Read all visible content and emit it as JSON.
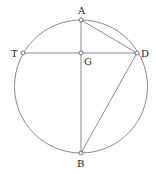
{
  "diagram": {
    "type": "geometry",
    "circle": {
      "cx": 81,
      "cy": 86.5,
      "r": 66.5,
      "stroke": "#8a8a8a"
    },
    "line_color": "#8a8a8a",
    "points": [
      {
        "id": "A",
        "label": "A",
        "x": 81,
        "y": 20,
        "lx": 78,
        "ly": 14
      },
      {
        "id": "T",
        "label": "T",
        "x": 23,
        "y": 53,
        "lx": 11,
        "ly": 57
      },
      {
        "id": "G",
        "label": "G",
        "x": 81,
        "y": 53,
        "lx": 84,
        "ly": 65
      },
      {
        "id": "D",
        "label": "D",
        "x": 137,
        "y": 53,
        "lx": 141,
        "ly": 57
      },
      {
        "id": "B",
        "label": "B",
        "x": 81,
        "y": 153,
        "lx": 77,
        "ly": 167
      }
    ],
    "segments": [
      [
        "A",
        "B"
      ],
      [
        "T",
        "D"
      ],
      [
        "A",
        "D"
      ],
      [
        "D",
        "B"
      ]
    ]
  }
}
